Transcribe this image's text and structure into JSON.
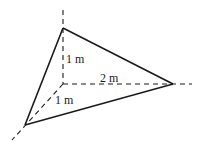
{
  "diagram": {
    "type": "3d-tetrahedron-on-axes",
    "colors": {
      "stroke": "#1a1a1a",
      "background": "#ffffff"
    },
    "origin": [
      63,
      84
    ],
    "vertices": {
      "top": [
        63,
        28
      ],
      "right": [
        173,
        84
      ],
      "front": [
        25,
        125
      ]
    },
    "labels": {
      "vertical_edge": "1 m",
      "horizontal_edge": "2 m",
      "depth_edge": "1 m"
    }
  }
}
